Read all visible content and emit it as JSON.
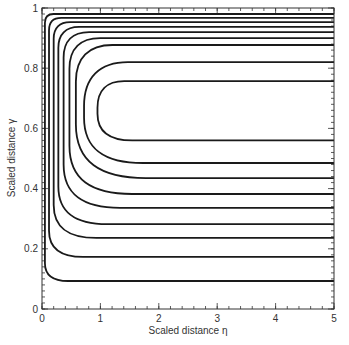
{
  "chart_data": {
    "type": "line",
    "title": "",
    "xlabel": "Scaled distance η",
    "ylabel": "Scaled distance γ",
    "xlim": [
      0,
      5
    ],
    "ylim": [
      0,
      1
    ],
    "x_ticks": [
      0,
      1,
      2,
      3,
      4,
      5
    ],
    "x_tick_labels": [
      "0",
      "1",
      "2",
      "3",
      "4",
      "5"
    ],
    "y_ticks": [
      0,
      0.2,
      0.4,
      0.6,
      0.8,
      1
    ],
    "y_tick_labels": [
      "0",
      "0.2",
      "0.4",
      "0.6",
      "0.8",
      "1"
    ],
    "x_minor_step": 0.2,
    "y_minor_step": 0.02,
    "grid": false,
    "legend": null,
    "series": [
      {
        "name": "contour-1",
        "upper": 0.98,
        "lower": 0.093,
        "turn_eta": 0.05
      },
      {
        "name": "contour-2",
        "upper": 0.967,
        "lower": 0.173,
        "turn_eta": 0.12
      },
      {
        "name": "contour-3",
        "upper": 0.953,
        "lower": 0.236,
        "turn_eta": 0.2
      },
      {
        "name": "contour-4",
        "upper": 0.937,
        "lower": 0.282,
        "turn_eta": 0.28
      },
      {
        "name": "contour-5",
        "upper": 0.92,
        "lower": 0.336,
        "turn_eta": 0.37
      },
      {
        "name": "contour-6",
        "upper": 0.9,
        "lower": 0.382,
        "turn_eta": 0.47
      },
      {
        "name": "contour-7",
        "upper": 0.877,
        "lower": 0.435,
        "turn_eta": 0.58
      },
      {
        "name": "contour-8",
        "upper": 0.82,
        "lower": 0.485,
        "turn_eta": 0.72
      },
      {
        "name": "contour-9",
        "upper": 0.757,
        "lower": 0.56,
        "turn_eta": 0.95
      }
    ]
  }
}
